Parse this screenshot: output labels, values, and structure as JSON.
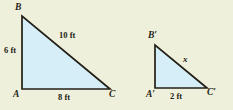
{
  "figure": {
    "background_color": "#eff0dc",
    "fill_color": "#d5eef8",
    "stroke_color": "#231f16",
    "triangles": [
      {
        "name": "large-triangle-ABC",
        "vertices": {
          "A": {
            "label": "A",
            "x": 22,
            "y": 89
          },
          "B": {
            "label": "B",
            "x": 22,
            "y": 16
          },
          "C": {
            "label": "C",
            "x": 110,
            "y": 89
          }
        },
        "sides": {
          "vertical": {
            "label": "6 ft",
            "value": 6,
            "unit": "ft"
          },
          "hypotenuse": {
            "label": "10 ft",
            "value": 10,
            "unit": "ft"
          },
          "base": {
            "label": "8 ft",
            "value": 8,
            "unit": "ft"
          }
        }
      },
      {
        "name": "small-triangle-A-B-C-prime",
        "vertices": {
          "A_prime": {
            "label": "A′",
            "x": 155,
            "y": 88
          },
          "B_prime": {
            "label": "B′",
            "x": 155,
            "y": 45
          },
          "C_prime": {
            "label": "C′",
            "x": 207,
            "y": 88
          }
        },
        "sides": {
          "hypotenuse": {
            "label": "x",
            "value": "x",
            "unit": ""
          },
          "base": {
            "label": "2 ft",
            "value": 2,
            "unit": "ft"
          }
        }
      }
    ]
  }
}
